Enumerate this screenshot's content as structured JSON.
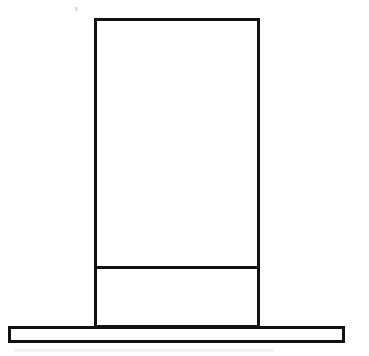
{
  "figure": {
    "background_color": "#ffffff",
    "stroke_color": "#111111",
    "canvas": {
      "width": 369,
      "height": 356
    },
    "shapes": {
      "column": {
        "name": "column-outline",
        "label": "Upright column",
        "x": 95.5,
        "y": 19.5,
        "width": 163,
        "height": 307,
        "stroke_width": 3
      },
      "divider": {
        "name": "column-divider-line",
        "label": "Horizontal divider band line",
        "x1": 95.5,
        "y1": 267.5,
        "x2": 258.5,
        "y2": 267.5,
        "stroke_width": 3
      },
      "base_bar": {
        "name": "base-bar-outline",
        "label": "Base bar",
        "x": 9.5,
        "y": 327.5,
        "width": 334,
        "height": 14,
        "stroke_width": 3
      }
    },
    "artifacts": {
      "speck": {
        "name": "scan-speck",
        "x": 75,
        "y": 7,
        "width": 3,
        "height": 4
      },
      "smudge": {
        "name": "scan-smudge",
        "x": 14,
        "y": 349,
        "width": 260,
        "height": 3
      }
    }
  }
}
